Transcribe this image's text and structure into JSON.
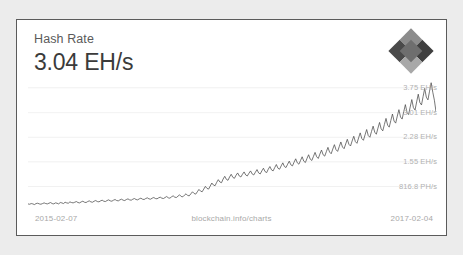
{
  "card": {
    "title": "Hash Rate",
    "value": "3.04 EH/s"
  },
  "logo": {
    "name": "blockchain-info-diamond-logo",
    "colors": {
      "top_left": "#8c8c8c",
      "top_right": "#3f3f3f",
      "bottom_left": "#4a4a4a",
      "bottom_right": "#a8a8a8",
      "center": "#6e6e6e"
    }
  },
  "footer": {
    "date_start": "2015-02-07",
    "source": "blockchain.info/charts",
    "date_end": "2017-02-04"
  },
  "axis": {
    "y_labels": [
      "3.75 EH/s",
      "3.01 EH/s",
      "2.28 EH/s",
      "1.55 EH/s",
      "816.8 PH/s"
    ]
  },
  "colors": {
    "page_background": "#ececec",
    "card_background": "#ffffff",
    "card_border": "#5b5b5b",
    "line": "#4a4a4a",
    "gridline": "#ededed",
    "title_text": "#5a5a5a",
    "value_text": "#3b3b3b",
    "tick_text": "#b2b2b2",
    "footer_text": "#a8a8a8"
  },
  "chart_data": {
    "type": "line",
    "title": "Hash Rate",
    "xlabel": "",
    "ylabel": "",
    "grid": true,
    "legend": null,
    "x_range": [
      "2015-02-07",
      "2017-02-04"
    ],
    "y_unit": "EH/s",
    "ylim": [
      0.0,
      4.1
    ],
    "y_ticks": [
      0.8168,
      1.55,
      2.28,
      3.01,
      3.75
    ],
    "y_tick_labels": [
      "816.8 PH/s",
      "1.55 EH/s",
      "2.28 EH/s",
      "3.01 EH/s",
      "3.75 EH/s"
    ],
    "current_value": 3.04,
    "values": [
      0.3,
      0.29,
      0.31,
      0.3,
      0.28,
      0.31,
      0.32,
      0.3,
      0.29,
      0.31,
      0.33,
      0.31,
      0.3,
      0.32,
      0.34,
      0.31,
      0.3,
      0.33,
      0.32,
      0.3,
      0.34,
      0.33,
      0.31,
      0.35,
      0.33,
      0.32,
      0.36,
      0.34,
      0.33,
      0.35,
      0.37,
      0.34,
      0.33,
      0.36,
      0.38,
      0.35,
      0.34,
      0.37,
      0.39,
      0.36,
      0.35,
      0.38,
      0.4,
      0.37,
      0.36,
      0.39,
      0.41,
      0.38,
      0.37,
      0.4,
      0.42,
      0.39,
      0.38,
      0.41,
      0.43,
      0.4,
      0.39,
      0.42,
      0.44,
      0.41,
      0.4,
      0.43,
      0.45,
      0.42,
      0.41,
      0.44,
      0.46,
      0.43,
      0.42,
      0.45,
      0.47,
      0.44,
      0.43,
      0.46,
      0.48,
      0.45,
      0.44,
      0.47,
      0.49,
      0.46,
      0.45,
      0.48,
      0.5,
      0.47,
      0.46,
      0.49,
      0.52,
      0.48,
      0.47,
      0.51,
      0.54,
      0.5,
      0.49,
      0.53,
      0.57,
      0.52,
      0.51,
      0.56,
      0.6,
      0.55,
      0.54,
      0.6,
      0.66,
      0.61,
      0.59,
      0.66,
      0.73,
      0.68,
      0.66,
      0.74,
      0.82,
      0.76,
      0.74,
      0.83,
      0.92,
      0.86,
      0.84,
      0.94,
      1.02,
      0.95,
      0.93,
      1.04,
      1.12,
      1.03,
      1.0,
      1.1,
      1.18,
      1.09,
      1.06,
      1.15,
      1.22,
      1.13,
      1.1,
      1.18,
      1.25,
      1.16,
      1.13,
      1.21,
      1.28,
      1.19,
      1.16,
      1.24,
      1.32,
      1.22,
      1.19,
      1.28,
      1.36,
      1.26,
      1.23,
      1.33,
      1.41,
      1.31,
      1.28,
      1.38,
      1.47,
      1.36,
      1.33,
      1.43,
      1.52,
      1.41,
      1.38,
      1.48,
      1.57,
      1.46,
      1.43,
      1.54,
      1.64,
      1.52,
      1.48,
      1.59,
      1.7,
      1.57,
      1.53,
      1.65,
      1.76,
      1.63,
      1.59,
      1.71,
      1.83,
      1.7,
      1.65,
      1.78,
      1.9,
      1.76,
      1.72,
      1.85,
      1.98,
      1.84,
      1.79,
      1.93,
      2.06,
      1.91,
      1.86,
      2.0,
      2.14,
      1.99,
      1.94,
      2.08,
      2.22,
      2.07,
      2.02,
      2.17,
      2.31,
      2.15,
      2.1,
      2.26,
      2.41,
      2.24,
      2.19,
      2.35,
      2.51,
      2.33,
      2.28,
      2.45,
      2.61,
      2.43,
      2.37,
      2.55,
      2.72,
      2.53,
      2.47,
      2.66,
      2.84,
      2.64,
      2.58,
      2.78,
      2.97,
      2.76,
      2.7,
      2.91,
      3.1,
      2.88,
      2.82,
      3.04,
      3.25,
      3.02,
      2.95,
      3.18,
      3.4,
      3.16,
      3.09,
      3.33,
      3.56,
      3.31,
      3.24,
      3.49,
      3.73,
      3.47,
      3.39,
      3.65,
      3.9,
      3.62,
      3.38,
      3.04
    ]
  }
}
